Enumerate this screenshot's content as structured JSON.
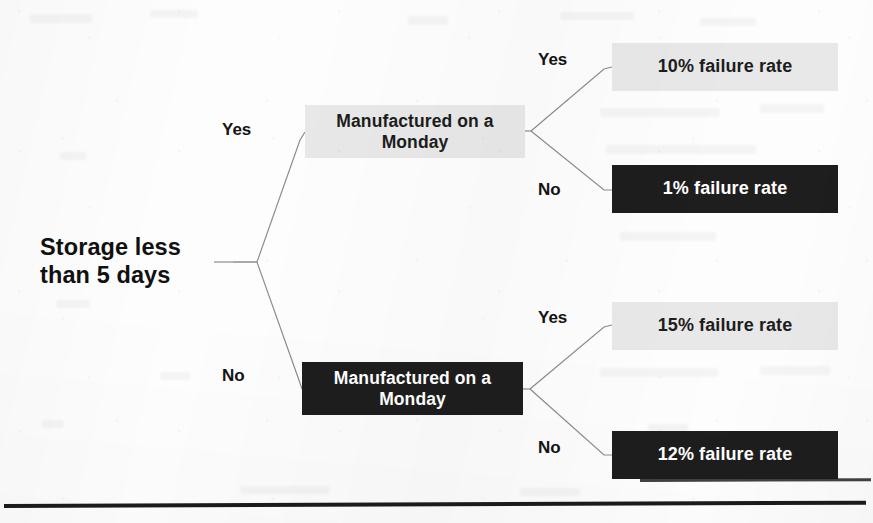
{
  "diagram": {
    "type": "decision-tree",
    "root": {
      "label": "Storage less\nthan 5 days",
      "line1": "Storage less",
      "line2": "than 5 days",
      "style": "plain"
    },
    "branch_labels": {
      "yes": "Yes",
      "no": "No"
    },
    "nodes": [
      {
        "id": "manufactured-monday-yes-path",
        "line1": "Manufactured on a",
        "line2": "Monday",
        "style": "light",
        "parent_branch": "Yes"
      },
      {
        "id": "manufactured-monday-no-path",
        "line1": "Manufactured on a",
        "line2": "Monday",
        "style": "dark",
        "parent_branch": "No"
      }
    ],
    "leaves": [
      {
        "id": "leaf-storage-yes-monday-yes",
        "label": "10% failure rate",
        "style": "light",
        "path": "Yes > Yes",
        "value": 10
      },
      {
        "id": "leaf-storage-yes-monday-no",
        "label": "1% failure rate",
        "style": "dark",
        "path": "Yes > No",
        "value": 1
      },
      {
        "id": "leaf-storage-no-monday-yes",
        "label": "15% failure rate",
        "style": "light",
        "path": "No > Yes",
        "value": 15
      },
      {
        "id": "leaf-storage-no-monday-no",
        "label": "12% failure rate",
        "style": "dark",
        "path": "No > No",
        "value": 12
      }
    ],
    "edge_labels": {
      "root_yes": "Yes",
      "root_no": "No",
      "top_yes": "Yes",
      "top_no": "No",
      "bottom_yes": "Yes",
      "bottom_no": "No"
    },
    "colors": {
      "light_box_bg": "#e8e8e8",
      "light_box_text": "#1d1d1d",
      "dark_box_bg": "#1e1e1e",
      "dark_box_text": "#ffffff",
      "edge_stroke": "#8d8d8d",
      "rule": "#1c1c1c",
      "page_bg": "#fdfdfd"
    }
  }
}
